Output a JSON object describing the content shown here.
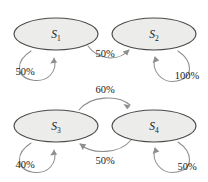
{
  "diagram": {
    "type": "state-transition-diagram",
    "title": "",
    "background_color": "#ffffff",
    "node_fill_color": "#ececeb",
    "node_stroke_color": "#4a4a48",
    "edge_color": "#8e8e8c",
    "label_color": "#1a1a1a",
    "states": [
      {
        "id": "s1",
        "base": "S",
        "subscript": "1",
        "cx": 56,
        "cy": 34,
        "rx": 42,
        "ry": 16
      },
      {
        "id": "s2",
        "base": "S",
        "subscript": "2",
        "cx": 154,
        "cy": 34,
        "rx": 42,
        "ry": 16
      },
      {
        "id": "s3",
        "base": "S",
        "subscript": "3",
        "cx": 56,
        "cy": 126,
        "rx": 42,
        "ry": 16
      },
      {
        "id": "s4",
        "base": "S",
        "subscript": "4",
        "cx": 154,
        "cy": 126,
        "rx": 42,
        "ry": 16
      }
    ],
    "transitions": [
      {
        "id": "t-s1-s1",
        "from": "s1",
        "to": "s1",
        "label": "50%",
        "kind": "self-loop",
        "label_x": 25,
        "label_y": 75
      },
      {
        "id": "t-s1-s2",
        "from": "s1",
        "to": "s2",
        "label": "50%",
        "kind": "arc-down",
        "label_x": 105,
        "label_y": 57
      },
      {
        "id": "t-s2-s2",
        "from": "s2",
        "to": "s2",
        "label": "100%",
        "kind": "self-loop",
        "label_x": 187,
        "label_y": 79
      },
      {
        "id": "t-s3-s4",
        "from": "s3",
        "to": "s4",
        "label": "60%",
        "kind": "arc-up",
        "label_x": 105,
        "label_y": 93
      },
      {
        "id": "t-s4-s3",
        "from": "s4",
        "to": "s3",
        "label": "50%",
        "kind": "arc-down",
        "label_x": 105,
        "label_y": 164
      },
      {
        "id": "t-s3-s3",
        "from": "s3",
        "to": "s3",
        "label": "40%",
        "kind": "self-loop",
        "label_x": 25,
        "label_y": 168
      },
      {
        "id": "t-s4-s4",
        "from": "s4",
        "to": "s4",
        "label": "50%",
        "kind": "self-loop",
        "label_x": 187,
        "label_y": 170
      }
    ]
  }
}
